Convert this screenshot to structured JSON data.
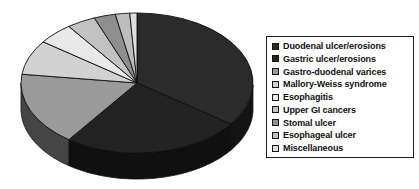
{
  "chart_data": {
    "type": "pie",
    "title": "",
    "subtitle": "",
    "xlabel": "",
    "ylabel": "",
    "three_d": true,
    "legend_position": "right",
    "grid": false,
    "categories": [
      "Duodenal ulcer/erosions",
      "Gastric ulcer/erosions",
      "Gastro-duodenal varices",
      "Mallory-Weiss syndrome",
      "Esophagitis",
      "Upper GI cancers",
      "Stomal ulcer",
      "Esophageal ulcer",
      "Miscellaneous"
    ],
    "values": [
      35,
      25,
      17,
      8,
      5,
      4,
      3,
      2,
      1
    ],
    "colors": [
      "#2b2b2b",
      "#232323",
      "#9a9a9a",
      "#d2d2d2",
      "#e8e8e8",
      "#c2c2c2",
      "#8e8e8e",
      "#bdbdbd",
      "#dedede"
    ],
    "start_angle_deg": -90,
    "direction": "clockwise"
  },
  "legend": {
    "items": [
      {
        "label": "Duodenal ulcer/erosions",
        "color": "#2b2b2b"
      },
      {
        "label": "Gastric ulcer/erosions",
        "color": "#232323"
      },
      {
        "label": "Gastro-duodenal varices",
        "color": "#9a9a9a"
      },
      {
        "label": "Mallory-Weiss syndrome",
        "color": "#d2d2d2"
      },
      {
        "label": "Esophagitis",
        "color": "#e8e8e8"
      },
      {
        "label": "Upper GI cancers",
        "color": "#c2c2c2"
      },
      {
        "label": "Stomal ulcer",
        "color": "#8e8e8e"
      },
      {
        "label": "Esophageal ulcer",
        "color": "#bdbdbd"
      },
      {
        "label": "Miscellaneous",
        "color": "#dedede"
      }
    ]
  },
  "pie_geometry": {
    "center_x": 137,
    "center_y": 83,
    "radius_x": 116,
    "radius_y": 70,
    "depth": 26,
    "outline_color": "#0f0f0f"
  }
}
